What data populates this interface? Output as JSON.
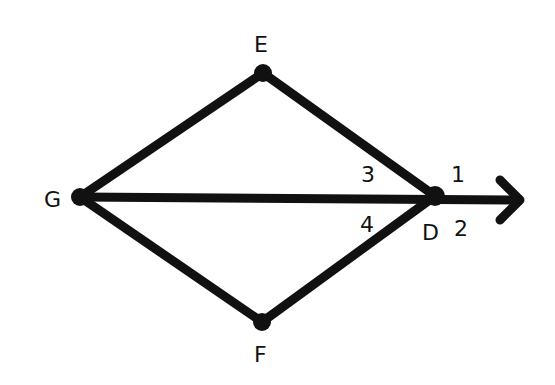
{
  "diagram": {
    "stroke_color": "#111111",
    "background": "#ffffff",
    "points": {
      "G": {
        "label": "G",
        "x": 80,
        "y": 197
      },
      "E": {
        "label": "E",
        "x": 263,
        "y": 73
      },
      "D": {
        "label": "D",
        "x": 435,
        "y": 196
      },
      "F": {
        "label": "F",
        "x": 262,
        "y": 322
      }
    },
    "segments": [
      "GE",
      "ED",
      "GD",
      "GF",
      "FD"
    ],
    "ray": {
      "from": "D",
      "direction": "right",
      "arrow": true
    },
    "angle_labels": [
      {
        "label": "1",
        "position": "above ray, right of D"
      },
      {
        "label": "2",
        "position": "below ray, right of D"
      },
      {
        "label": "3",
        "position": "between DE and DG"
      },
      {
        "label": "4",
        "position": "between DG and DF"
      }
    ]
  }
}
